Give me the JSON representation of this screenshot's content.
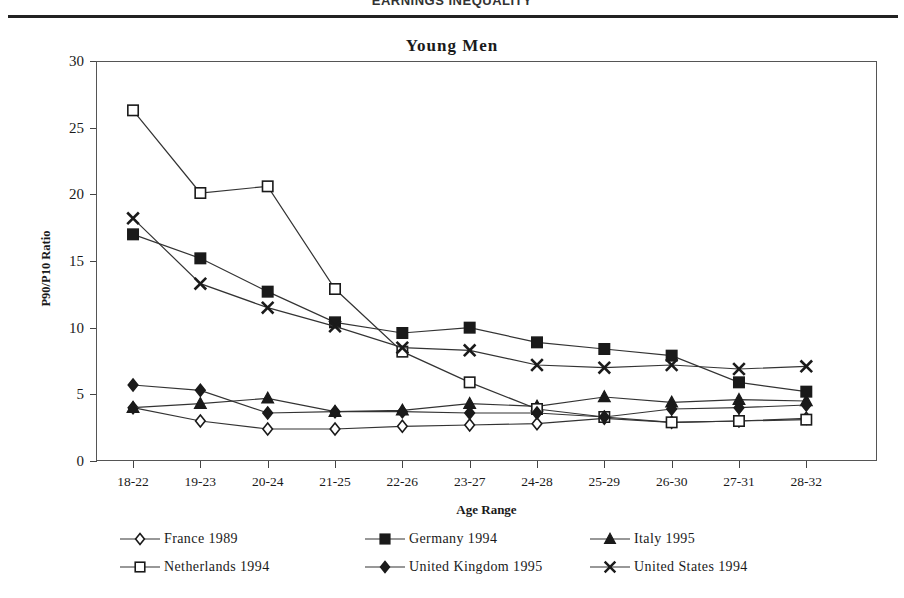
{
  "page_header": {
    "text": "EARNINGS INEQUALITY"
  },
  "chart_data": {
    "type": "line",
    "title": "Young Men",
    "xlabel": "Age Range",
    "ylabel": "P90/P10 Ratio",
    "ylim": [
      0,
      30
    ],
    "yticks": [
      0,
      5,
      10,
      15,
      20,
      25,
      30
    ],
    "grid": false,
    "legend_position": "bottom",
    "categories": [
      "18-22",
      "19-23",
      "20-24",
      "21-25",
      "22-26",
      "23-27",
      "24-28",
      "25-29",
      "26-30",
      "27-31",
      "28-32"
    ],
    "series": [
      {
        "name": "France 1989",
        "marker": "open-diamond",
        "values": [
          4.0,
          3.0,
          2.4,
          2.4,
          2.6,
          2.7,
          2.8,
          3.2,
          2.9,
          3.0,
          3.2
        ]
      },
      {
        "name": "Germany 1994",
        "marker": "filled-square",
        "values": [
          17.0,
          15.2,
          12.7,
          10.4,
          9.6,
          10.0,
          8.9,
          8.4,
          7.9,
          5.9,
          5.2
        ]
      },
      {
        "name": "Italy 1995",
        "marker": "filled-triangle",
        "values": [
          4.0,
          4.3,
          4.7,
          3.7,
          3.8,
          4.3,
          4.1,
          4.8,
          4.4,
          4.6,
          4.5
        ]
      },
      {
        "name": "Netherlands 1994",
        "marker": "open-square",
        "values": [
          26.3,
          20.1,
          20.6,
          12.9,
          8.2,
          5.9,
          3.9,
          3.3,
          2.9,
          3.0,
          3.1
        ]
      },
      {
        "name": "United Kingdom 1995",
        "marker": "filled-diamond",
        "values": [
          5.7,
          5.3,
          3.6,
          3.7,
          3.7,
          3.6,
          3.6,
          3.3,
          3.9,
          4.0,
          4.2
        ]
      },
      {
        "name": "United States 1994",
        "marker": "x-cross",
        "values": [
          18.2,
          13.3,
          11.5,
          10.1,
          8.5,
          8.3,
          7.2,
          7.0,
          7.2,
          6.9,
          7.1
        ]
      }
    ],
    "colors": {
      "line": "#333333",
      "marker_fill": "#1a1a1a",
      "marker_open_fill": "#ffffff",
      "axis": "#555555",
      "background": "#ffffff"
    }
  }
}
